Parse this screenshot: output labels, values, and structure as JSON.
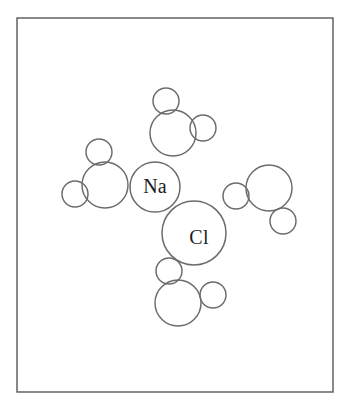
{
  "figure": {
    "background_color": "#ffffff",
    "stroke_color": "#6b6b6b",
    "frame_color": "#585858",
    "label_color": "#1c1c1c",
    "frame": {
      "x": 17,
      "y": 18,
      "width": 316,
      "height": 374
    },
    "ions": [
      {
        "name": "sodium-ion",
        "label": "Na",
        "cx": 155,
        "cy": 187,
        "r": 25
      },
      {
        "name": "chloride-ion",
        "label": "Cl",
        "cx": 194,
        "cy": 233,
        "r": 32
      }
    ],
    "water_molecules": [
      {
        "name": "water-top",
        "oxygen": {
          "cx": 173,
          "cy": 133,
          "r": 23
        },
        "hydrogens": [
          {
            "cx": 166,
            "cy": 101,
            "r": 13
          },
          {
            "cx": 203,
            "cy": 128,
            "r": 13
          }
        ]
      },
      {
        "name": "water-left",
        "oxygen": {
          "cx": 105,
          "cy": 185,
          "r": 23
        },
        "hydrogens": [
          {
            "cx": 99,
            "cy": 152,
            "r": 13
          },
          {
            "cx": 75,
            "cy": 194,
            "r": 13
          }
        ]
      },
      {
        "name": "water-right",
        "oxygen": {
          "cx": 269,
          "cy": 188,
          "r": 23
        },
        "hydrogens": [
          {
            "cx": 236,
            "cy": 196,
            "r": 13
          },
          {
            "cx": 283,
            "cy": 221,
            "r": 13
          }
        ]
      },
      {
        "name": "water-bottom",
        "oxygen": {
          "cx": 178,
          "cy": 303,
          "r": 23
        },
        "hydrogens": [
          {
            "cx": 169,
            "cy": 271,
            "r": 13
          },
          {
            "cx": 213,
            "cy": 295,
            "r": 13
          }
        ]
      }
    ]
  }
}
